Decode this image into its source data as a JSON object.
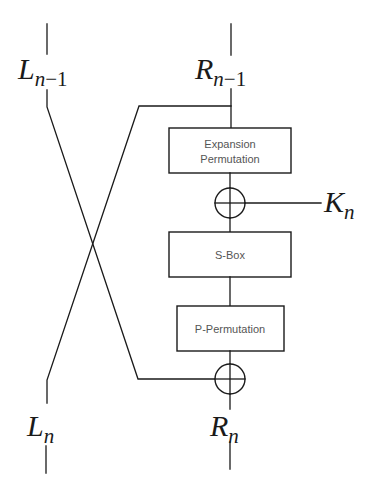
{
  "diagram": {
    "type": "feistel-round",
    "colors": {
      "stroke": "#1a1a1a",
      "box_text": "#555555",
      "background": "#ffffff"
    },
    "inputs": {
      "left": {
        "main": "L",
        "sub": "n",
        "sub_suffix": "−1"
      },
      "right": {
        "main": "R",
        "sub": "n",
        "sub_suffix": "−1"
      }
    },
    "outputs": {
      "left": {
        "main": "L",
        "sub": "n"
      },
      "right": {
        "main": "R",
        "sub": "n"
      }
    },
    "key": {
      "main": "K",
      "sub": "n"
    },
    "boxes": [
      {
        "id": "expansion",
        "lines": [
          "Expansion",
          "Permutation"
        ]
      },
      {
        "id": "sbox",
        "lines": [
          "S-Box"
        ]
      },
      {
        "id": "pperm",
        "lines": [
          "P-Permutation"
        ]
      }
    ],
    "operators": [
      {
        "id": "xor-key",
        "symbol": "⊕"
      },
      {
        "id": "xor-left",
        "symbol": "⊕"
      }
    ]
  }
}
